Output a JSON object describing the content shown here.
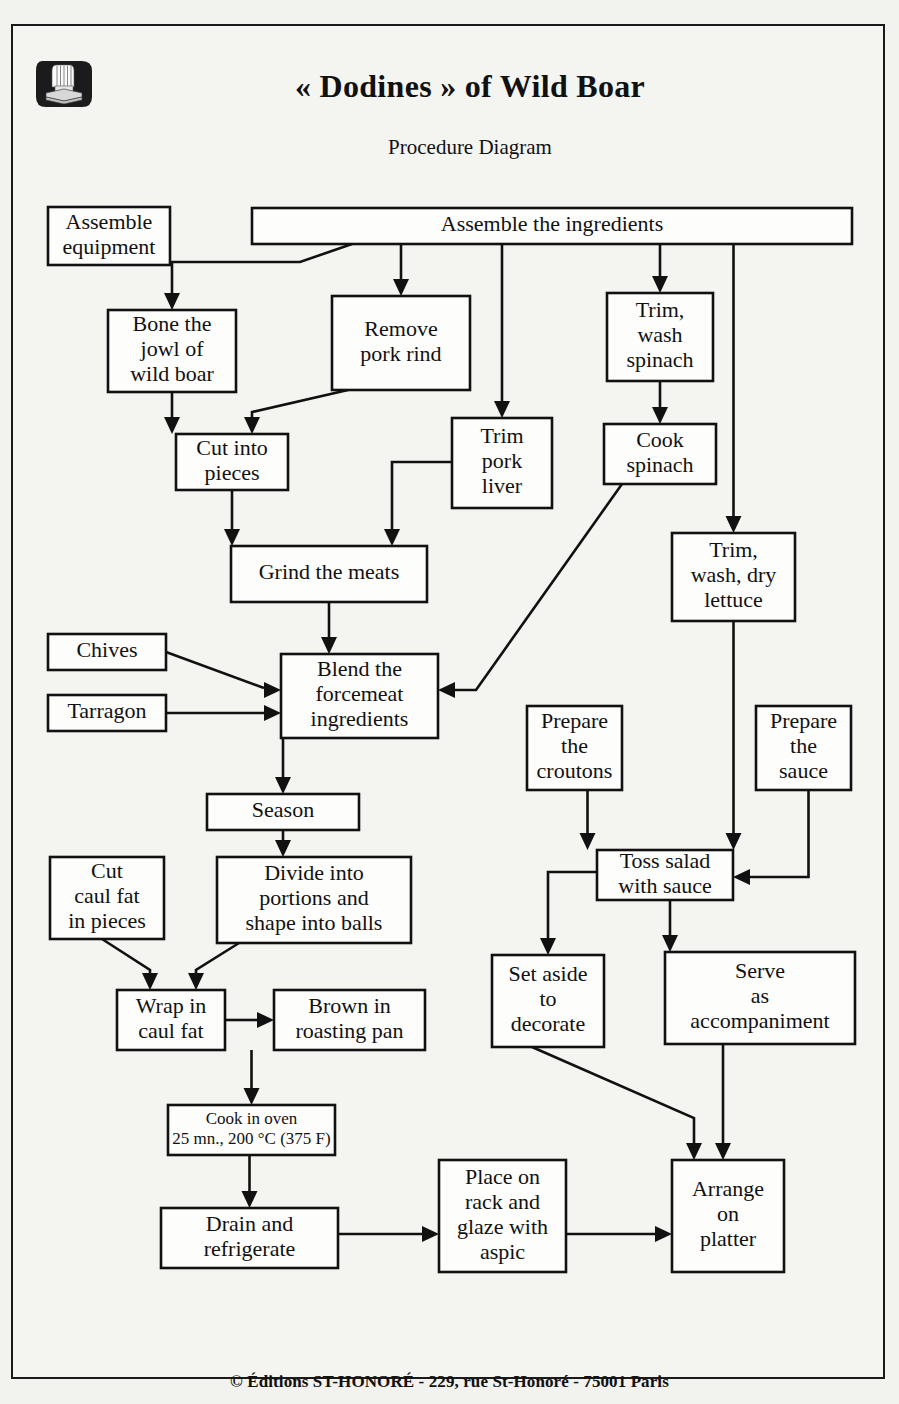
{
  "document": {
    "title": "« Dodines » of Wild Boar",
    "subtitle": "Procedure Diagram",
    "footer": "© Éditions ST-HONORÉ - 229, rue St-Honoré - 75001 Paris",
    "logo": "chef-hat-on-books-icon",
    "ink_color": "#111111",
    "page_background": "#f4f4f1"
  },
  "chart_data": {
    "type": "diagram",
    "diagram_kind": "flowchart",
    "title": "« Dodines » of Wild Boar",
    "subtitle": "Procedure Diagram",
    "nodes": [
      {
        "id": "assemble_equipment",
        "label": "Assemble\nequipment",
        "x": 48,
        "y": 207,
        "w": 122,
        "h": 58
      },
      {
        "id": "assemble_ingredients",
        "label": "Assemble the ingredients",
        "x": 252,
        "y": 208,
        "w": 600,
        "h": 36
      },
      {
        "id": "bone_jowl",
        "label": "Bone the\njowl of\nwild boar",
        "x": 108,
        "y": 310,
        "w": 128,
        "h": 82
      },
      {
        "id": "remove_rind",
        "label": "Remove\npork rind",
        "x": 332,
        "y": 296,
        "w": 138,
        "h": 94
      },
      {
        "id": "trim_wash_spinach",
        "label": "Trim,\nwash\nspinach",
        "x": 607,
        "y": 293,
        "w": 106,
        "h": 88
      },
      {
        "id": "cut_pieces",
        "label": "Cut into\npieces",
        "x": 176,
        "y": 434,
        "w": 112,
        "h": 56
      },
      {
        "id": "trim_pork_liver",
        "label": "Trim\npork\nliver",
        "x": 452,
        "y": 418,
        "w": 100,
        "h": 90
      },
      {
        "id": "cook_spinach",
        "label": "Cook\nspinach",
        "x": 604,
        "y": 424,
        "w": 112,
        "h": 60
      },
      {
        "id": "grind_meats",
        "label": "Grind the meats",
        "x": 231,
        "y": 546,
        "w": 196,
        "h": 56
      },
      {
        "id": "trim_wash_dry_lettuce",
        "label": "Trim,\nwash, dry\nlettuce",
        "x": 672,
        "y": 533,
        "w": 123,
        "h": 88
      },
      {
        "id": "chives",
        "label": "Chives",
        "x": 48,
        "y": 634,
        "w": 118,
        "h": 36
      },
      {
        "id": "tarragon",
        "label": "Tarragon",
        "x": 48,
        "y": 695,
        "w": 118,
        "h": 36
      },
      {
        "id": "blend_forcemeat",
        "label": "Blend the\nforcemeat\ningredients",
        "x": 281,
        "y": 654,
        "w": 157,
        "h": 84
      },
      {
        "id": "prepare_croutons",
        "label": "Prepare\nthe\ncroutons",
        "x": 527,
        "y": 706,
        "w": 95,
        "h": 84
      },
      {
        "id": "prepare_sauce",
        "label": "Prepare\nthe\nsauce",
        "x": 756,
        "y": 706,
        "w": 95,
        "h": 84
      },
      {
        "id": "season",
        "label": "Season",
        "x": 207,
        "y": 794,
        "w": 152,
        "h": 36
      },
      {
        "id": "divide_portions",
        "label": "Divide into\nportions and\nshape into balls",
        "x": 217,
        "y": 857,
        "w": 194,
        "h": 86
      },
      {
        "id": "cut_caul_fat",
        "label": "Cut\ncaul fat\nin pieces",
        "x": 50,
        "y": 857,
        "w": 114,
        "h": 82
      },
      {
        "id": "toss_salad",
        "label": "Toss salad\nwith sauce",
        "x": 597,
        "y": 850,
        "w": 136,
        "h": 50
      },
      {
        "id": "set_aside",
        "label": "Set aside\nto\ndecorate",
        "x": 492,
        "y": 955,
        "w": 112,
        "h": 92
      },
      {
        "id": "serve_accompaniment",
        "label": "Serve\nas\naccompaniment",
        "x": 665,
        "y": 952,
        "w": 190,
        "h": 92
      },
      {
        "id": "wrap_caul_fat",
        "label": "Wrap in\ncaul fat",
        "x": 117,
        "y": 990,
        "w": 108,
        "h": 60
      },
      {
        "id": "brown_roasting_pan",
        "label": "Brown in\nroasting pan",
        "x": 274,
        "y": 990,
        "w": 151,
        "h": 60
      },
      {
        "id": "cook_oven",
        "label": "Cook in oven\n25 mn., 200 °C (375 F)",
        "x": 168,
        "y": 1105,
        "w": 167,
        "h": 50,
        "small": true
      },
      {
        "id": "drain_refrigerate",
        "label": "Drain and\nrefrigerate",
        "x": 161,
        "y": 1208,
        "w": 177,
        "h": 60
      },
      {
        "id": "place_rack_glaze",
        "label": "Place on\nrack and\nglaze with\naspic",
        "x": 439,
        "y": 1160,
        "w": 127,
        "h": 112
      },
      {
        "id": "arrange_platter",
        "label": "Arrange\non\nplatter",
        "x": 672,
        "y": 1160,
        "w": 112,
        "h": 112
      }
    ],
    "edges": [
      {
        "from": "assemble_ingredients",
        "to": "bone_jowl"
      },
      {
        "from": "assemble_ingredients",
        "to": "remove_rind"
      },
      {
        "from": "assemble_ingredients",
        "to": "trim_pork_liver"
      },
      {
        "from": "assemble_ingredients",
        "to": "trim_wash_spinach"
      },
      {
        "from": "assemble_ingredients",
        "to": "trim_wash_dry_lettuce"
      },
      {
        "from": "bone_jowl",
        "to": "cut_pieces"
      },
      {
        "from": "remove_rind",
        "to": "cut_pieces"
      },
      {
        "from": "trim_wash_spinach",
        "to": "cook_spinach"
      },
      {
        "from": "cut_pieces",
        "to": "grind_meats"
      },
      {
        "from": "trim_pork_liver",
        "to": "grind_meats"
      },
      {
        "from": "grind_meats",
        "to": "blend_forcemeat"
      },
      {
        "from": "chives",
        "to": "blend_forcemeat"
      },
      {
        "from": "tarragon",
        "to": "blend_forcemeat"
      },
      {
        "from": "cook_spinach",
        "to": "blend_forcemeat"
      },
      {
        "from": "blend_forcemeat",
        "to": "season"
      },
      {
        "from": "season",
        "to": "divide_portions"
      },
      {
        "from": "divide_portions",
        "to": "wrap_caul_fat"
      },
      {
        "from": "cut_caul_fat",
        "to": "wrap_caul_fat"
      },
      {
        "from": "wrap_caul_fat",
        "to": "brown_roasting_pan"
      },
      {
        "from": "brown_roasting_pan",
        "to": "cook_oven"
      },
      {
        "from": "cook_oven",
        "to": "drain_refrigerate"
      },
      {
        "from": "drain_refrigerate",
        "to": "place_rack_glaze"
      },
      {
        "from": "place_rack_glaze",
        "to": "arrange_platter"
      },
      {
        "from": "trim_wash_dry_lettuce",
        "to": "toss_salad"
      },
      {
        "from": "prepare_croutons",
        "to": "toss_salad"
      },
      {
        "from": "prepare_sauce",
        "to": "toss_salad"
      },
      {
        "from": "toss_salad",
        "to": "set_aside"
      },
      {
        "from": "toss_salad",
        "to": "serve_accompaniment"
      },
      {
        "from": "set_aside",
        "to": "arrange_platter"
      },
      {
        "from": "serve_accompaniment",
        "to": "arrange_platter"
      }
    ]
  }
}
